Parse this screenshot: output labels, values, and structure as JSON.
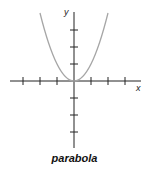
{
  "diagram": {
    "caption": "parabola",
    "x_axis_label": "x",
    "y_axis_label": "y",
    "equation_shape": "y = x^2",
    "curve_color": "#a6a6a6",
    "axis_color": "#222222",
    "x_ticks": [
      -3,
      -2,
      -1,
      1,
      2,
      3
    ],
    "y_ticks": [
      -3,
      -2,
      -1,
      1,
      2,
      3
    ]
  }
}
